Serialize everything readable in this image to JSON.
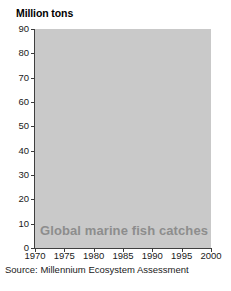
{
  "figure": {
    "axis_title": "Million tons",
    "caption": "Global marine fish catches",
    "source": "Source: Millennium Ecosystem Assessment",
    "colors": {
      "plot_background": "#c9c9c9",
      "gridline": "#ffffff",
      "line": "#6e6e6e",
      "axis": "#3f3f3f",
      "caption_text": "#8d8d8d",
      "page_background": "#ffffff"
    }
  },
  "chart_data": {
    "type": "line",
    "title": "Global marine fish catches",
    "subtitle": "",
    "xlabel": "",
    "ylabel": "Million tons",
    "xlim": [
      1970,
      2000
    ],
    "ylim": [
      0,
      90
    ],
    "ytick_labels": [
      "0",
      "10",
      "20",
      "30",
      "40",
      "50",
      "60",
      "70",
      "80",
      "90"
    ],
    "ytick_values": [
      0,
      10,
      20,
      30,
      40,
      50,
      60,
      70,
      80,
      90
    ],
    "xtick_labels": [
      "1970",
      "1975",
      "1980",
      "1985",
      "1990",
      "1995",
      "2000"
    ],
    "xtick_values": [
      1970,
      1975,
      1980,
      1985,
      1990,
      1995,
      2000
    ],
    "grid": true,
    "grid_axis": "both",
    "legend": "none",
    "annotations": [
      "Global marine fish catches"
    ],
    "series": [
      {
        "name": "Global marine fish catches",
        "x": [
          1970,
          1971,
          1972,
          1973,
          1974,
          1975,
          1976,
          1977,
          1978,
          1979,
          1980,
          1981,
          1982,
          1983,
          1984,
          1985,
          1986,
          1987,
          1988,
          1989,
          1990,
          1991,
          1992,
          1993,
          1994,
          1995,
          1996,
          1997,
          1998,
          1999,
          2000
        ],
        "values": [
          50.0,
          49.2,
          49.0,
          51.5,
          55.0,
          56.0,
          57.5,
          57.0,
          58.0,
          58.5,
          59.0,
          62.0,
          60.5,
          61.5,
          63.0,
          65.5,
          69.0,
          72.0,
          79.5,
          82.5,
          83.0,
          82.0,
          80.0,
          78.0,
          77.0,
          76.0,
          74.0,
          76.0,
          73.0,
          75.0,
          71.5
        ]
      }
    ]
  }
}
